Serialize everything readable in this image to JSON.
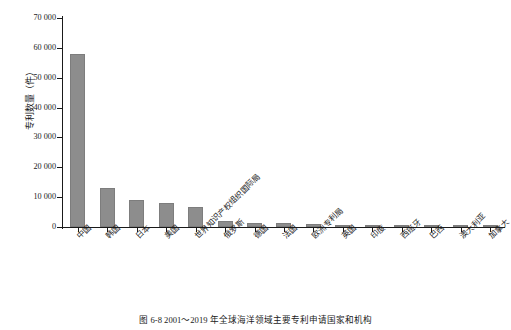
{
  "chart_data": {
    "type": "bar",
    "title": "",
    "xlabel": "",
    "ylabel": "专利数量（件）",
    "ylim": [
      0,
      70000
    ],
    "ytick_step": 10000,
    "ytick_labels": [
      "0",
      "10 000",
      "20 000",
      "30 000",
      "40 000",
      "50 000",
      "60 000",
      "70 000"
    ],
    "ytick_values": [
      0,
      10000,
      20000,
      30000,
      40000,
      50000,
      60000,
      70000
    ],
    "grid": false,
    "legend": false,
    "bar_color": "#8d8d8d",
    "axis_color": "#1a1a1a",
    "categories": [
      "中国",
      "韩国",
      "日本",
      "美国",
      "世界知识产权组织国际局",
      "俄罗斯",
      "德国",
      "法国",
      "欧洲专利局",
      "英国",
      "印度",
      "西班牙",
      "巴西",
      "澳大利亚",
      "加拿大"
    ],
    "values": [
      57800,
      13200,
      9000,
      8200,
      6700,
      1900,
      1500,
      1200,
      1000,
      800,
      500,
      400,
      350,
      300,
      250
    ]
  },
  "caption": {
    "text": "图 6-8    2001～2019 年全球海洋领域主要专利申请国家和机构"
  }
}
